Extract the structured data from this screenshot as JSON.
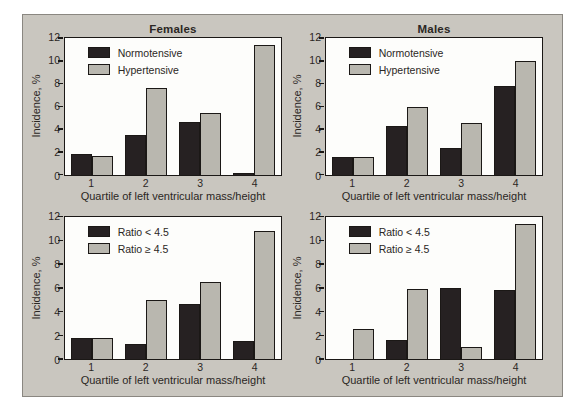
{
  "figure": {
    "background": "#ffffff",
    "panel_background": "#c9c6bf",
    "panel_border": "#8a8781"
  },
  "colors": {
    "dark": "#262122",
    "gray": "#b9b7af",
    "plot_bg": "#fdfdfb",
    "axis": "#1b1816",
    "text": "#2b2724"
  },
  "chart_data": [
    {
      "type": "bar",
      "title": "Females",
      "ylabel": "Incidence, %",
      "xlabel": "Quartile of left ventricular mass/height",
      "categories": [
        "1",
        "2",
        "3",
        "4"
      ],
      "ylim": [
        0,
        12
      ],
      "yticks": [
        0,
        2,
        4,
        6,
        8,
        10,
        12
      ],
      "grid": false,
      "legend_position": "top-left",
      "series": [
        {
          "name": "Normotensive",
          "color": "dark",
          "values": [
            1.8,
            3.5,
            4.6,
            0.15
          ]
        },
        {
          "name": "Hypertensive",
          "color": "gray",
          "values": [
            1.6,
            7.6,
            5.4,
            11.4
          ]
        }
      ]
    },
    {
      "type": "bar",
      "title": "Males",
      "ylabel": "Incidence, %",
      "xlabel": "Quartile of left ventricular mass/height",
      "categories": [
        "1",
        "2",
        "3",
        "4"
      ],
      "ylim": [
        0,
        12
      ],
      "yticks": [
        0,
        2,
        4,
        6,
        8,
        10,
        12
      ],
      "grid": false,
      "legend_position": "top-left",
      "series": [
        {
          "name": "Normotensive",
          "color": "dark",
          "values": [
            1.5,
            4.3,
            2.3,
            7.8
          ]
        },
        {
          "name": "Hypertensive",
          "color": "gray",
          "values": [
            1.5,
            5.9,
            4.5,
            10.0
          ]
        }
      ]
    },
    {
      "type": "bar",
      "title": "",
      "ylabel": "Incidence, %",
      "xlabel": "Quartile of left ventricular mass/height",
      "categories": [
        "1",
        "2",
        "3",
        "4"
      ],
      "ylim": [
        0,
        12
      ],
      "yticks": [
        0,
        2,
        4,
        6,
        8,
        10,
        12
      ],
      "grid": false,
      "legend_position": "top-left",
      "series": [
        {
          "name": "Ratio < 4.5",
          "color": "dark",
          "values": [
            1.8,
            1.3,
            4.6,
            1.5
          ]
        },
        {
          "name": "Ratio ≥ 4.5",
          "color": "gray",
          "values": [
            1.8,
            5.0,
            6.5,
            10.8
          ]
        }
      ]
    },
    {
      "type": "bar",
      "title": "",
      "ylabel": "Incidence, %",
      "xlabel": "Quartile of left ventricular mass/height",
      "categories": [
        "1",
        "2",
        "3",
        "4"
      ],
      "ylim": [
        0,
        12
      ],
      "yticks": [
        0,
        2,
        4,
        6,
        8,
        10,
        12
      ],
      "grid": false,
      "legend_position": "top-left",
      "series": [
        {
          "name": "Ratio < 4.5",
          "color": "dark",
          "values": [
            0,
            1.6,
            6.0,
            5.8
          ]
        },
        {
          "name": "Ratio ≥ 4.5",
          "color": "gray",
          "values": [
            2.5,
            5.9,
            1.0,
            11.4
          ]
        }
      ]
    }
  ]
}
